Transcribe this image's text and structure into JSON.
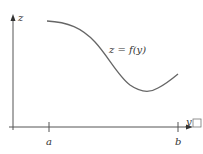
{
  "figure": {
    "axes": {
      "vertical_label": "z",
      "horizontal_label": "y",
      "horizontal_label_box": "□"
    },
    "curve_label": "z = f(y)",
    "ticks": [
      {
        "label": "a"
      },
      {
        "label": "b"
      }
    ]
  },
  "colors": {
    "axis": "#555555",
    "curve": "#666666",
    "text": "#333333"
  }
}
